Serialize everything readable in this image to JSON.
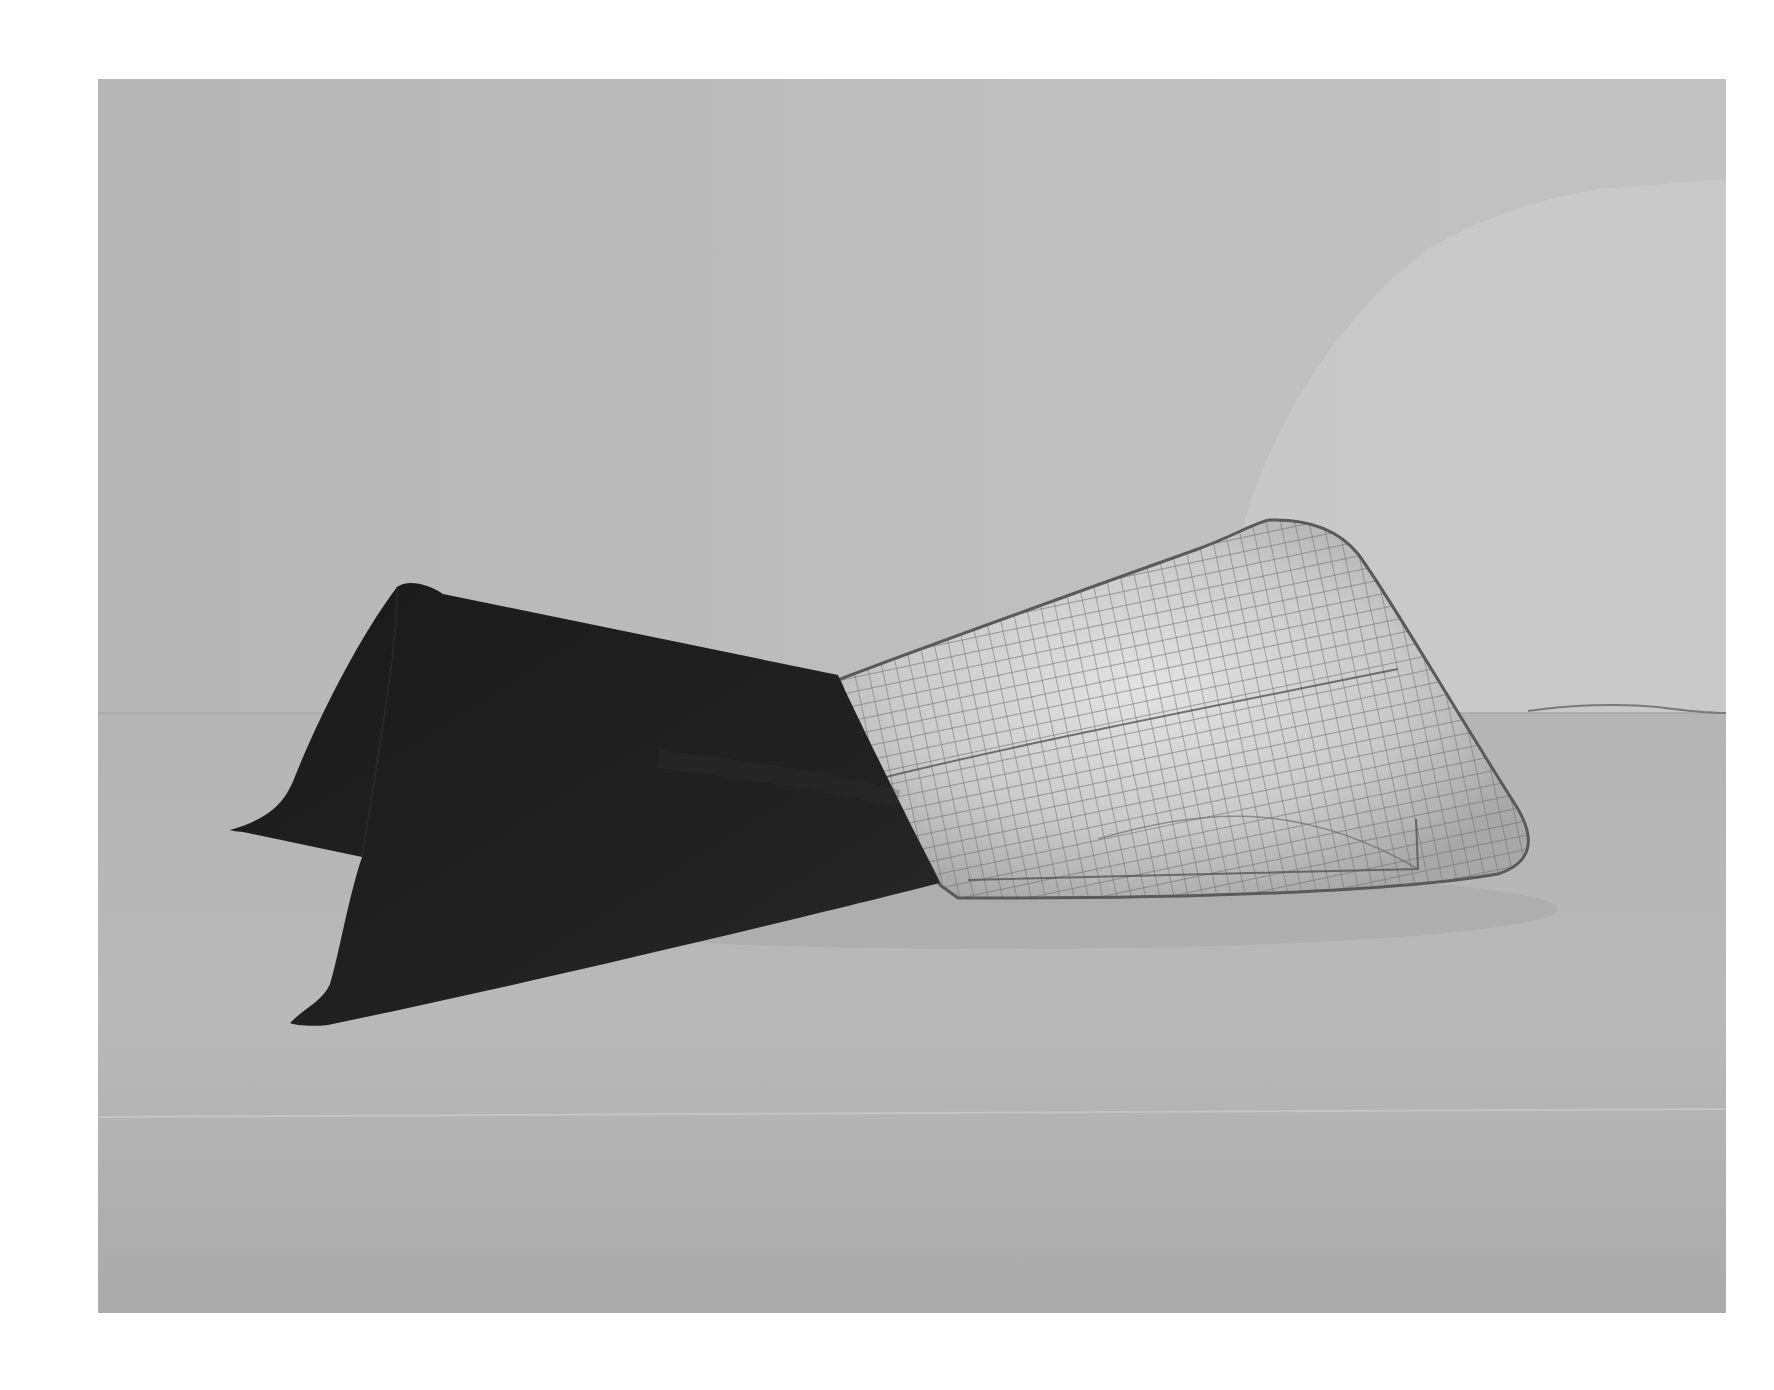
{
  "photo": {
    "description": "Black-and-white gallery photograph of a floor sculpture: a dark folded sheet cone joined to a translucent wire-mesh cone",
    "colors": {
      "page_background": "#ffffff",
      "wall": "#bdbdbd",
      "wall_light_patch": "#cfcfcf",
      "floor": "#b2b2b2",
      "floor_seam": "#c6c6c6",
      "dark_sheet": "#1c1c1c",
      "dark_sheet_highlight": "#2e2e2e",
      "mesh_fill": "#c4c4c4",
      "mesh_highlight": "#dcdcdc",
      "mesh_grid": "#6a6a6a",
      "mesh_edge": "#5a5a5a",
      "cord": "#7a7a7a"
    }
  }
}
